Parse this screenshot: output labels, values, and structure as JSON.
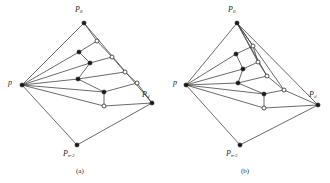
{
  "figure": {
    "background_color": "#ffffff",
    "edge_color": "#3a3a3a",
    "node_filled_color": "#1a1a1a",
    "node_hollow_fill": "#ffffff",
    "panels": [
      {
        "id": "panel-a",
        "caption": "(a)",
        "caption_x": 76,
        "caption_y": 167,
        "labels": [
          {
            "name": "label-p-left",
            "base": "p",
            "sub": "",
            "x": 8,
            "y": 79,
            "size": 8
          },
          {
            "name": "label-p0-top",
            "base": "P",
            "sub": "0",
            "x": 75,
            "y": 6,
            "size": 8
          },
          {
            "name": "label-pd-right",
            "base": "P",
            "sub": "d",
            "x": 142,
            "y": 91,
            "size": 8
          },
          {
            "name": "label-pn2-bottom",
            "base": "P",
            "sub": "n-2",
            "x": 63,
            "y": 150,
            "size": 8
          }
        ],
        "nodes": [
          {
            "name": "vertex-p",
            "x": 22,
            "y": 85,
            "type": "filled",
            "r": 2.1
          },
          {
            "name": "vertex-p0",
            "x": 84,
            "y": 23,
            "type": "filled",
            "r": 2.1
          },
          {
            "name": "vertex-pd",
            "x": 152,
            "y": 103,
            "type": "filled",
            "r": 2.1
          },
          {
            "name": "vertex-pn2",
            "x": 77,
            "y": 145,
            "type": "filled",
            "r": 2.1
          },
          {
            "name": "vertex-i1",
            "x": 97,
            "y": 41,
            "type": "hollow",
            "r": 2.0
          },
          {
            "name": "vertex-i2",
            "x": 79,
            "y": 52,
            "type": "filled",
            "r": 2.1
          },
          {
            "name": "vertex-i3",
            "x": 112,
            "y": 57,
            "type": "hollow",
            "r": 2.0
          },
          {
            "name": "vertex-i4",
            "x": 90,
            "y": 63,
            "type": "filled",
            "r": 2.1
          },
          {
            "name": "vertex-i5",
            "x": 125,
            "y": 72,
            "type": "hollow",
            "r": 2.0
          },
          {
            "name": "vertex-i6",
            "x": 78,
            "y": 79,
            "type": "filled",
            "r": 2.1
          },
          {
            "name": "vertex-i7",
            "x": 137,
            "y": 83,
            "type": "hollow",
            "r": 2.0
          },
          {
            "name": "vertex-i8",
            "x": 104,
            "y": 92,
            "type": "filled",
            "r": 2.1
          },
          {
            "name": "vertex-i9",
            "x": 104,
            "y": 106,
            "type": "hollow",
            "r": 2.0
          }
        ],
        "edges": [
          {
            "name": "edge-p-p0",
            "from": "vertex-p",
            "to": "vertex-p0"
          },
          {
            "name": "edge-p-i2",
            "from": "vertex-p",
            "to": "vertex-i2"
          },
          {
            "name": "edge-p-i4",
            "from": "vertex-p",
            "to": "vertex-i4"
          },
          {
            "name": "edge-p-i6",
            "from": "vertex-p",
            "to": "vertex-i6"
          },
          {
            "name": "edge-p-i8",
            "from": "vertex-p",
            "to": "vertex-i8"
          },
          {
            "name": "edge-p-i9",
            "from": "vertex-p",
            "to": "vertex-i9"
          },
          {
            "name": "edge-p-pn2",
            "from": "vertex-p",
            "to": "vertex-pn2"
          },
          {
            "name": "edge-p0-i1",
            "from": "vertex-p0",
            "to": "vertex-i1"
          },
          {
            "name": "edge-p0-pd",
            "from": "vertex-p0",
            "to": "vertex-pd"
          },
          {
            "name": "edge-i1-i2",
            "from": "vertex-i1",
            "to": "vertex-i2"
          },
          {
            "name": "edge-i1-i3",
            "from": "vertex-i1",
            "to": "vertex-i3"
          },
          {
            "name": "edge-i2-i4",
            "from": "vertex-i2",
            "to": "vertex-i4"
          },
          {
            "name": "edge-i3-i4",
            "from": "vertex-i3",
            "to": "vertex-i4"
          },
          {
            "name": "edge-i3-i5",
            "from": "vertex-i3",
            "to": "vertex-i5"
          },
          {
            "name": "edge-i4-i6",
            "from": "vertex-i4",
            "to": "vertex-i6"
          },
          {
            "name": "edge-i5-i6",
            "from": "vertex-i5",
            "to": "vertex-i6"
          },
          {
            "name": "edge-i5-i7",
            "from": "vertex-i5",
            "to": "vertex-i7"
          },
          {
            "name": "edge-i6-i8",
            "from": "vertex-i6",
            "to": "vertex-i8"
          },
          {
            "name": "edge-i7-i8",
            "from": "vertex-i7",
            "to": "vertex-i8"
          },
          {
            "name": "edge-i7-pd",
            "from": "vertex-i7",
            "to": "vertex-pd"
          },
          {
            "name": "edge-i8-i9",
            "from": "vertex-i8",
            "to": "vertex-i9"
          },
          {
            "name": "edge-i9-pd",
            "from": "vertex-i9",
            "to": "vertex-pd"
          },
          {
            "name": "edge-pn2-pd",
            "from": "vertex-pn2",
            "to": "vertex-pd"
          }
        ]
      },
      {
        "id": "panel-b",
        "caption": "(b)",
        "caption_x": 241,
        "caption_y": 167,
        "labels": [
          {
            "name": "label-p-left",
            "base": "p",
            "sub": "",
            "x": 173,
            "y": 79,
            "size": 8
          },
          {
            "name": "label-p0-top",
            "base": "P",
            "sub": "0",
            "x": 228,
            "y": 6,
            "size": 8
          },
          {
            "name": "label-pd-right",
            "base": "P",
            "sub": "d",
            "x": 309,
            "y": 91,
            "size": 8
          },
          {
            "name": "label-pn2-bottom",
            "base": "P",
            "sub": "n-2",
            "x": 226,
            "y": 150,
            "size": 8
          }
        ],
        "nodes": [
          {
            "name": "vertex-p",
            "x": 186,
            "y": 85,
            "type": "filled",
            "r": 2.1
          },
          {
            "name": "vertex-p0",
            "x": 237,
            "y": 23,
            "type": "filled",
            "r": 2.1
          },
          {
            "name": "vertex-pd",
            "x": 318,
            "y": 105,
            "type": "filled",
            "r": 2.1
          },
          {
            "name": "vertex-pn2",
            "x": 240,
            "y": 145,
            "type": "filled",
            "r": 2.1
          },
          {
            "name": "vertex-j1",
            "x": 253,
            "y": 46,
            "type": "hollow",
            "r": 2.0
          },
          {
            "name": "vertex-j2",
            "x": 236,
            "y": 54,
            "type": "filled",
            "r": 2.1
          },
          {
            "name": "vertex-j3",
            "x": 258,
            "y": 62,
            "type": "hollow",
            "r": 2.0
          },
          {
            "name": "vertex-j4",
            "x": 243,
            "y": 69,
            "type": "filled",
            "r": 2.1
          },
          {
            "name": "vertex-j5",
            "x": 267,
            "y": 76,
            "type": "hollow",
            "r": 2.0
          },
          {
            "name": "vertex-j6",
            "x": 238,
            "y": 83,
            "type": "filled",
            "r": 2.1
          },
          {
            "name": "vertex-j7",
            "x": 284,
            "y": 90,
            "type": "hollow",
            "r": 2.0
          },
          {
            "name": "vertex-j8",
            "x": 264,
            "y": 94,
            "type": "filled",
            "r": 2.1
          },
          {
            "name": "vertex-j9",
            "x": 264,
            "y": 108,
            "type": "hollow",
            "r": 2.0
          }
        ],
        "edges": [
          {
            "name": "edge-p-p0",
            "from": "vertex-p",
            "to": "vertex-p0"
          },
          {
            "name": "edge-p-j2",
            "from": "vertex-p",
            "to": "vertex-j2"
          },
          {
            "name": "edge-p-j4",
            "from": "vertex-p",
            "to": "vertex-j4"
          },
          {
            "name": "edge-p-j6",
            "from": "vertex-p",
            "to": "vertex-j6"
          },
          {
            "name": "edge-p-j8",
            "from": "vertex-p",
            "to": "vertex-j8"
          },
          {
            "name": "edge-p-j9",
            "from": "vertex-p",
            "to": "vertex-j9"
          },
          {
            "name": "edge-p-pn2",
            "from": "vertex-p",
            "to": "vertex-pn2"
          },
          {
            "name": "edge-p0-j1",
            "from": "vertex-p0",
            "to": "vertex-j1"
          },
          {
            "name": "edge-p0-j3",
            "from": "vertex-p0",
            "to": "vertex-j3"
          },
          {
            "name": "edge-p0-j5",
            "from": "vertex-p0",
            "to": "vertex-j5"
          },
          {
            "name": "edge-p0-j7",
            "from": "vertex-p0",
            "to": "vertex-j7"
          },
          {
            "name": "edge-p0-pd",
            "from": "vertex-p0",
            "to": "vertex-pd"
          },
          {
            "name": "edge-j1-j2",
            "from": "vertex-j1",
            "to": "vertex-j2"
          },
          {
            "name": "edge-j1-j3",
            "from": "vertex-j1",
            "to": "vertex-j3"
          },
          {
            "name": "edge-j2-j4",
            "from": "vertex-j2",
            "to": "vertex-j4"
          },
          {
            "name": "edge-j3-j4",
            "from": "vertex-j3",
            "to": "vertex-j4"
          },
          {
            "name": "edge-j3-j5",
            "from": "vertex-j3",
            "to": "vertex-j5"
          },
          {
            "name": "edge-j4-j6",
            "from": "vertex-j4",
            "to": "vertex-j6"
          },
          {
            "name": "edge-j5-j6",
            "from": "vertex-j5",
            "to": "vertex-j6"
          },
          {
            "name": "edge-j5-j7",
            "from": "vertex-j5",
            "to": "vertex-j7"
          },
          {
            "name": "edge-j6-j8",
            "from": "vertex-j6",
            "to": "vertex-j8"
          },
          {
            "name": "edge-j7-j8",
            "from": "vertex-j7",
            "to": "vertex-j8"
          },
          {
            "name": "edge-j7-pd",
            "from": "vertex-j7",
            "to": "vertex-pd"
          },
          {
            "name": "edge-j8-j9",
            "from": "vertex-j8",
            "to": "vertex-j9"
          },
          {
            "name": "edge-j9-pd",
            "from": "vertex-j9",
            "to": "vertex-pd"
          },
          {
            "name": "edge-pn2-pd",
            "from": "vertex-pn2",
            "to": "vertex-pd"
          }
        ]
      }
    ]
  }
}
